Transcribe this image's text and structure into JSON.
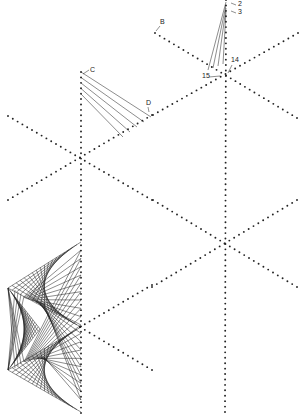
{
  "diagram": {
    "colors": {
      "dot": "#222222",
      "line": "#1a1a1a",
      "background": "#ffffff"
    },
    "labels": [
      {
        "id": "label-2",
        "text": "2",
        "x": 238,
        "y": 6
      },
      {
        "id": "label-3",
        "text": "3",
        "x": 238,
        "y": 14
      },
      {
        "id": "label-B",
        "text": "B",
        "x": 160,
        "y": 24
      },
      {
        "id": "label-C",
        "text": "C",
        "x": 90,
        "y": 72
      },
      {
        "id": "label-D",
        "text": "D",
        "x": 146,
        "y": 105
      },
      {
        "id": "label-14",
        "text": "14",
        "x": 231,
        "y": 62
      },
      {
        "id": "label-15",
        "text": "15",
        "x": 202,
        "y": 78
      }
    ],
    "stars": [
      {
        "name": "top-right",
        "center": [
          226,
          75
        ]
      },
      {
        "name": "middle",
        "center": [
          80,
          157
        ]
      },
      {
        "name": "lower-right",
        "center": [
          225,
          243
        ]
      },
      {
        "name": "bottom-left",
        "center": [
          80,
          327
        ]
      }
    ]
  }
}
